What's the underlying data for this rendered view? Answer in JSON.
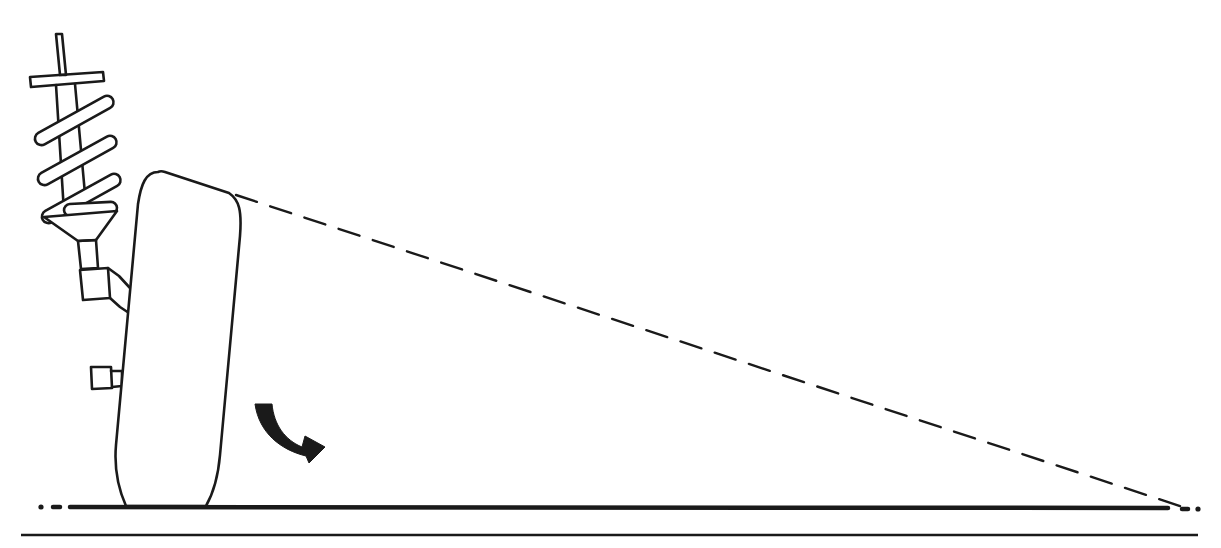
{
  "diagram": {
    "colors": {
      "background": "#ffffff",
      "ink": "#1a1a1a"
    },
    "elements": [
      "strut-with-coil-spring",
      "tilted-tire",
      "rotation-arrow",
      "dashed-projection-line",
      "ground-line",
      "baseline"
    ],
    "labels": []
  }
}
